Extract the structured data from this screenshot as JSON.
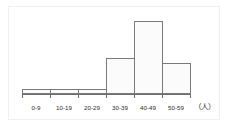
{
  "chart_data": {
    "type": "bar",
    "title": "",
    "subtitle": "",
    "xlabel": "",
    "ylabel": "",
    "unit_label": "（人）",
    "categories": [
      "0-9",
      "10-19",
      "20-29",
      "30-39",
      "40-49",
      "50-59"
    ],
    "values": [
      1,
      1,
      1,
      7,
      14,
      6
    ],
    "ylim": [
      0,
      15
    ],
    "xlim_categories": 6,
    "grid": false,
    "legend": null,
    "axis_visible": {
      "x": true,
      "y": false
    },
    "tick_marks": [
      "0-9",
      "10-19",
      "20-29",
      "30-39",
      "40-49",
      "50-59"
    ],
    "style": {
      "bar_fill": "#fbfbfb",
      "bar_border": "#7a7a7a",
      "axis_color": "#6e6e6e",
      "text_color": "#2b2b2b",
      "frame_color": "#f0f0f0",
      "background": "#ffffff"
    }
  },
  "figure": {
    "width_px": 230,
    "height_px": 130,
    "plot_left_px": 22,
    "plot_right_px": 190,
    "baseline_y_px": 94,
    "bar_pixel_heights": [
      6,
      6,
      6,
      39,
      73,
      32
    ]
  }
}
